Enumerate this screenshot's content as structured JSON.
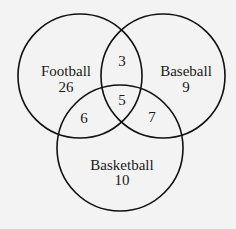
{
  "diagram": {
    "type": "venn",
    "sets": [
      {
        "label": "Football",
        "only": "26",
        "cx": 80,
        "cy": 76,
        "r": 62
      },
      {
        "label": "Baseball",
        "only": "9",
        "cx": 163,
        "cy": 76,
        "r": 62
      },
      {
        "label": "Basketball",
        "only": "10",
        "cx": 120,
        "cy": 148,
        "r": 63
      }
    ],
    "intersections": {
      "football_baseball": "3",
      "football_basketball": "6",
      "baseball_basketball": "7",
      "all_three": "5"
    },
    "colors": {
      "background": "#f3f3f3",
      "stroke": "#111111",
      "text": "#1a1a1a"
    }
  }
}
